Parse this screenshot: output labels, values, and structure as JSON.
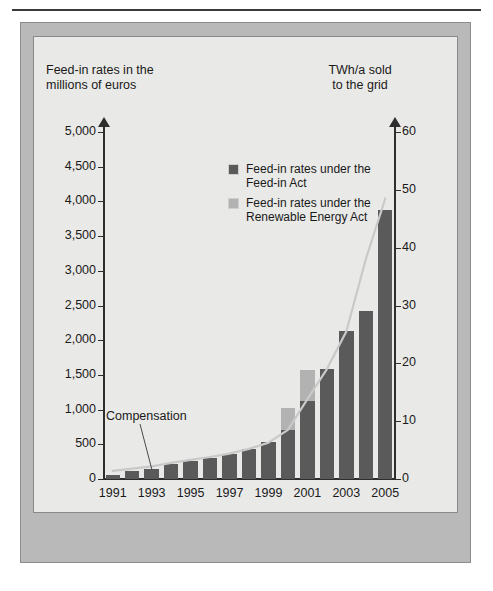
{
  "figure": {
    "left_axis_title": "Feed-in rates in the millions of euros",
    "left_axis_title_line1": "Feed-in rates in the",
    "left_axis_title_line2": "millions of euros",
    "right_axis_title_line1": "TWh/a sold",
    "right_axis_title_line2": "to the grid",
    "annotation": "Compensation",
    "legend": [
      {
        "label_line1": "Feed-in rates under the",
        "label_line2": "Feed-in Act",
        "color": "#5a5a5a"
      },
      {
        "label_line1": "Feed-in rates under the",
        "label_line2": "Renewable Energy Act",
        "color": "#b2b2b2"
      }
    ]
  },
  "chart_data": {
    "type": "bar",
    "title": "",
    "xlabel": "",
    "ylabel": "Feed-in rates in the millions of euros",
    "y2label": "TWh/a sold to the grid",
    "ylim": [
      0,
      5000
    ],
    "y2lim": [
      0,
      60
    ],
    "yticks": [
      "0",
      "500",
      "1,000",
      "1,500",
      "2,000",
      "2,500",
      "3,000",
      "3,500",
      "4,000",
      "4,500",
      "5,000"
    ],
    "ytick_values": [
      0,
      500,
      1000,
      1500,
      2000,
      2500,
      3000,
      3500,
      4000,
      4500,
      5000
    ],
    "y2ticks": [
      "0",
      "10",
      "20",
      "30",
      "40",
      "50",
      "60"
    ],
    "y2tick_values": [
      0,
      10,
      20,
      30,
      40,
      50,
      60
    ],
    "grid": false,
    "legend_position": "upper-center",
    "categories": [
      1991,
      1992,
      1993,
      1994,
      1995,
      1996,
      1997,
      1998,
      1999,
      2000,
      2001,
      2002,
      2003,
      2004,
      2005
    ],
    "xtick_labels": [
      "1991",
      "1993",
      "1995",
      "1997",
      "1999",
      "2001",
      "2003",
      "2005"
    ],
    "xtick_categories": [
      1991,
      1993,
      1995,
      1997,
      1999,
      2001,
      2003,
      2005
    ],
    "series": [
      {
        "name": "Feed-in rates under the Feed-in Act",
        "color": "#5a5a5a",
        "axis": "left",
        "values": [
          60,
          110,
          150,
          210,
          260,
          300,
          360,
          430,
          540,
          700,
          1120,
          1580,
          2130,
          2420,
          3280
        ]
      },
      {
        "name": "Feed-in rates under the Renewable Energy Act",
        "color": "#b2b2b2",
        "axis": "left",
        "values": [
          0,
          0,
          0,
          0,
          0,
          0,
          0,
          0,
          0,
          330,
          450,
          0,
          0,
          0,
          0
        ]
      },
      {
        "name": "Total feed-in rates (2005)",
        "color": "#5a5a5a",
        "axis": "left",
        "values": [
          null,
          null,
          null,
          null,
          null,
          null,
          null,
          null,
          null,
          null,
          null,
          null,
          null,
          null,
          3880
        ]
      },
      {
        "name": "TWh/a sold to the grid",
        "color": "#c9c9c9",
        "axis": "right",
        "type": "line",
        "values": [
          1.4,
          1.8,
          2.2,
          2.8,
          3.3,
          3.8,
          4.4,
          5.2,
          6.3,
          8.5,
          13.8,
          19.0,
          25.5,
          38.0,
          48.5
        ]
      }
    ]
  }
}
